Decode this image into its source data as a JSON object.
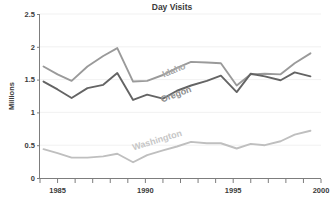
{
  "chart_data": {
    "type": "line",
    "title": "Day Visits",
    "xlabel": "",
    "ylabel": "Millions",
    "xlim": [
      1984,
      2000
    ],
    "ylim": [
      0,
      2.5
    ],
    "grid": true,
    "legend_position": "inline-labels",
    "x_ticks": [
      1985,
      1990,
      1995,
      2000
    ],
    "x_tick_labels": [
      "1985",
      "1990",
      "1995",
      "2000"
    ],
    "x_minor_ticks": [
      1984,
      1985,
      1986,
      1987,
      1988,
      1989,
      1990,
      1991,
      1992,
      1993,
      1994,
      1995,
      1996,
      1997,
      1998,
      1999,
      2000
    ],
    "y_ticks": [
      0,
      0.5,
      1,
      1.5,
      2,
      2.5
    ],
    "y_tick_labels": [
      "0",
      "0.5",
      "1",
      "1.5",
      "2",
      "2.5"
    ],
    "x": [
      1984.2,
      1985.0,
      1985.8,
      1986.7,
      1987.6,
      1988.4,
      1989.3,
      1990.1,
      1991.0,
      1991.8,
      1992.6,
      1993.5,
      1994.3,
      1995.2,
      1996.0,
      1996.8,
      1997.7,
      1998.5,
      1999.4
    ],
    "series": [
      {
        "name": "Idaho",
        "color": "#9a9a9a",
        "values": [
          1.7,
          1.58,
          1.48,
          1.7,
          1.86,
          1.98,
          1.47,
          1.48,
          1.57,
          1.68,
          1.77,
          1.76,
          1.75,
          1.41,
          1.58,
          1.59,
          1.58,
          1.75,
          1.9
        ]
      },
      {
        "name": "Oregon",
        "color": "#646464",
        "values": [
          1.47,
          1.35,
          1.22,
          1.37,
          1.42,
          1.6,
          1.19,
          1.27,
          1.21,
          1.33,
          1.41,
          1.48,
          1.56,
          1.31,
          1.59,
          1.55,
          1.49,
          1.61,
          1.55
        ]
      },
      {
        "name": "Washington",
        "color": "#bfbfbf",
        "values": [
          0.44,
          0.38,
          0.31,
          0.31,
          0.33,
          0.37,
          0.24,
          0.35,
          0.42,
          0.48,
          0.55,
          0.53,
          0.53,
          0.45,
          0.52,
          0.5,
          0.56,
          0.66,
          0.72
        ]
      }
    ],
    "series_label_colors": {
      "Idaho": "#a8a8a8",
      "Oregon": "#8e8e8e",
      "Washington": "#c6c6c6"
    },
    "colors": {
      "background": "#ffffff",
      "gridline": "#ededed",
      "axis": "#7d7d7d",
      "text": "#3b3b3b"
    }
  }
}
